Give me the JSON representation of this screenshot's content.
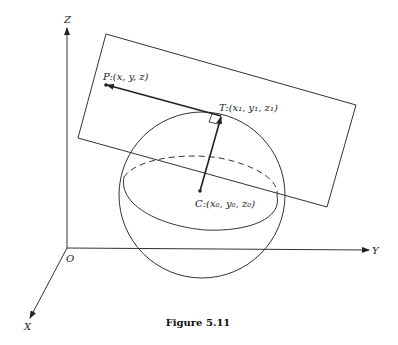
{
  "figure": {
    "caption": "Figure 5.11",
    "axes": {
      "z_label": "Z",
      "y_label": "Y",
      "x_label": "X",
      "origin_label": "O"
    },
    "points": {
      "P": {
        "name": "P",
        "coords": ":(x, y, z)"
      },
      "T": {
        "name": "T",
        "coords": ":(x₁, y₁, z₁)"
      },
      "C": {
        "name": "C",
        "coords": ":(x₀, y₀, z₀)"
      }
    },
    "colors": {
      "line": "#333333",
      "background": "#ffffff"
    }
  }
}
